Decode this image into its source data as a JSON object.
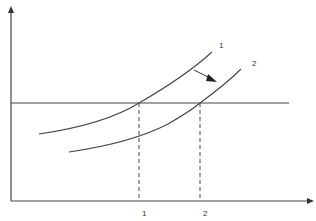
{
  "diagram": {
    "type": "economic-shift-diagram",
    "axes": {
      "x_label": "",
      "y_label": ""
    },
    "curves": [
      {
        "id": "curve-1",
        "label": "1",
        "description": "original upward-sloping curve"
      },
      {
        "id": "curve-2",
        "label": "2",
        "description": "shifted curve (down/right)"
      }
    ],
    "horizontal_line": {
      "description": "constant level line"
    },
    "x_markers": [
      {
        "label": "1",
        "description": "intersection of curve 1 with horizontal line"
      },
      {
        "label": "2",
        "description": "intersection of curve 2 with horizontal line"
      }
    ],
    "shift_arrow": {
      "from": "curve-1",
      "to": "curve-2",
      "direction": "down-right"
    },
    "colors": {
      "line": "#444444",
      "background": "#ffffff"
    }
  }
}
